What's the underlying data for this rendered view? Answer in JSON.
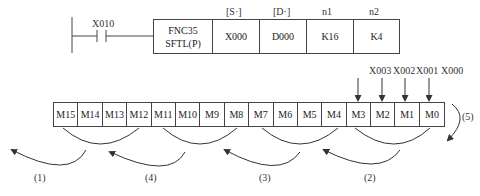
{
  "ladder": {
    "contact_label": "X010",
    "instruction": {
      "fnc": "FNC35",
      "mnemonic": "SFTL(P)",
      "operand_headers": [
        "[S·]",
        "[D·]",
        "n1",
        "n2"
      ],
      "operands": [
        "X000",
        "D000",
        "K16",
        "K4"
      ]
    }
  },
  "register": {
    "bits": [
      "M15",
      "M14",
      "M13",
      "M12",
      "M11",
      "M10",
      "M9",
      "M8",
      "M7",
      "M6",
      "M5",
      "M4",
      "M3",
      "M2",
      "M1",
      "M0"
    ],
    "inputs": [
      "X003",
      "X002",
      "X001",
      "X000"
    ]
  },
  "steps": [
    "(1)",
    "(4)",
    "(3)",
    "(2)",
    "(5)"
  ],
  "colors": {
    "line": "#444444",
    "text": "#222222"
  }
}
